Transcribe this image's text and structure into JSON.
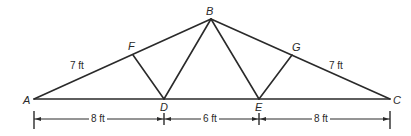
{
  "diagram": {
    "type": "roof truss",
    "nodes": [
      {
        "id": "A",
        "label": "A",
        "x": 34,
        "y": 99
      },
      {
        "id": "B",
        "label": "B",
        "x": 211,
        "y": 19
      },
      {
        "id": "C",
        "label": "C",
        "x": 390,
        "y": 99
      },
      {
        "id": "D",
        "label": "D",
        "x": 164,
        "y": 99
      },
      {
        "id": "E",
        "label": "E",
        "x": 259,
        "y": 99
      },
      {
        "id": "F",
        "label": "F",
        "x": 133,
        "y": 55
      },
      {
        "id": "G",
        "label": "G",
        "x": 292,
        "y": 55
      }
    ],
    "members": [
      [
        "A",
        "B"
      ],
      [
        "B",
        "C"
      ],
      [
        "A",
        "C"
      ],
      [
        "F",
        "D"
      ],
      [
        "D",
        "B"
      ],
      [
        "B",
        "E"
      ],
      [
        "E",
        "G"
      ]
    ],
    "slope_labels": {
      "AF": "7 ft",
      "GC": "7 ft"
    },
    "dimensions": [
      {
        "from": "A",
        "to": "D",
        "label": "8 ft"
      },
      {
        "from": "D",
        "to": "E",
        "label": "6 ft"
      },
      {
        "from": "E",
        "to": "C",
        "label": "8 ft"
      }
    ],
    "colors": {
      "line": "#2a2a2a",
      "background": "#ffffff"
    }
  }
}
